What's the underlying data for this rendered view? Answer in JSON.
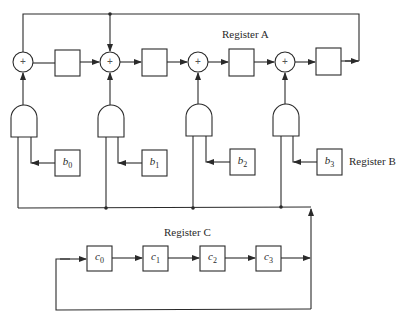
{
  "figure": {
    "labels": {
      "register_a": "Register A",
      "register_b": "Register B",
      "register_c": "Register C"
    },
    "xor_symbol": "+",
    "register_a": {
      "cells": [
        "",
        "",
        "",
        ""
      ]
    },
    "register_b": {
      "cells": [
        {
          "var": "b",
          "sub": "0"
        },
        {
          "var": "b",
          "sub": "1"
        },
        {
          "var": "b",
          "sub": "2"
        },
        {
          "var": "b",
          "sub": "3"
        }
      ]
    },
    "register_c": {
      "cells": [
        {
          "var": "c",
          "sub": "0"
        },
        {
          "var": "c",
          "sub": "1"
        },
        {
          "var": "c",
          "sub": "2"
        },
        {
          "var": "c",
          "sub": "3"
        }
      ]
    },
    "components": {
      "xor_gates": 4,
      "and_gates": 4
    },
    "colors": {
      "line": "#2a2a2a",
      "background": "#ffffff"
    }
  }
}
